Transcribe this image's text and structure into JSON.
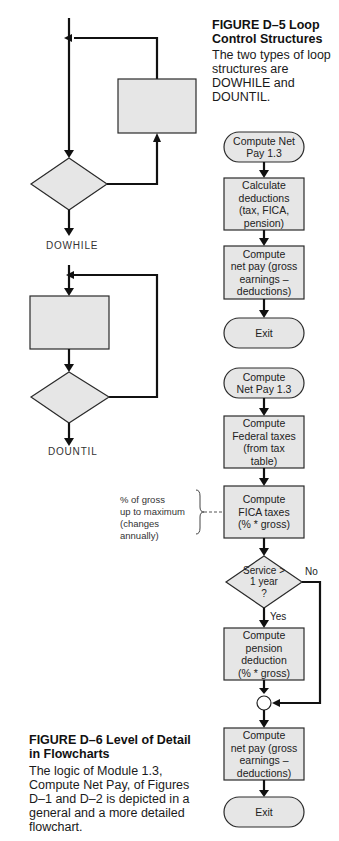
{
  "figure_d5": {
    "title_line1": "FIGURE D–5   Loop",
    "title_line2": "Control Structures",
    "body": "The two types of loop structures are DOWHILE and DOUNTIL.",
    "dowhile_label": "DOWHILE",
    "dountil_label": "DOUNTIL"
  },
  "general_flowchart": {
    "start": "Compute Net\nPay 1.3",
    "step1": "Calculate\ndeductions\n(tax, FICA,\npension)",
    "step2": "Compute\nnet pay (gross\nearnings –\ndeductions)",
    "end": "Exit"
  },
  "detailed_flowchart": {
    "start": "Compute\nNet Pay 1.3",
    "step1": "Compute\nFederal taxes\n(from tax\ntable)",
    "step2": "Compute\nFICA taxes\n(% * gross)",
    "decision": "Service >\n1 year\n?",
    "yes_label": "Yes",
    "no_label": "No",
    "step3": "Compute pension\ndeduction\n(% * gross)",
    "step4": "Compute\nnet pay (gross\nearnings –\ndeductions)",
    "end": "Exit",
    "annotation": "% of gross\nup to maximum\n(changes annually)"
  },
  "figure_d6": {
    "title_line1": "FIGURE D–6   Level of Detail",
    "title_line2": "in Flowcharts",
    "body": "The logic of Module 1.3, Compute Net Pay, of Figures D–1 and D–2 is depicted in a general and a more detailed flowchart."
  }
}
